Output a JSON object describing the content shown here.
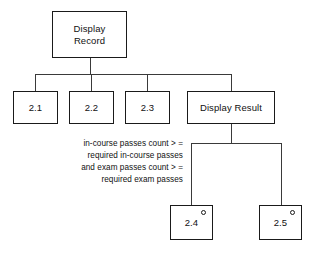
{
  "diagram": {
    "type": "structure-chart",
    "title_node": "Display\nRecord",
    "nodes": [
      {
        "id": "root",
        "label": "Display\nRecord"
      },
      {
        "id": "n21",
        "label": "2.1"
      },
      {
        "id": "n22",
        "label": "2.2"
      },
      {
        "id": "n23",
        "label": "2.3"
      },
      {
        "id": "display_result",
        "label": "Display Result"
      },
      {
        "id": "n24",
        "label": "2.4",
        "marker": "circle"
      },
      {
        "id": "n25",
        "label": "2.5",
        "marker": "circle"
      }
    ],
    "annotation": {
      "condition": "in-course passes count > =\nrequired in-course passes\nand exam passes count > =\nrequired exam passes"
    },
    "colors": {
      "background": "#ffffff",
      "box_border": "#1a1a1a",
      "connector": "#3a3a3a",
      "text": "#111111"
    }
  }
}
